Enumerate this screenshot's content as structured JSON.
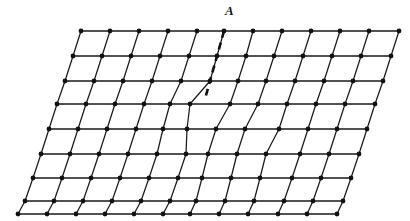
{
  "figure": {
    "kind": "crystal-lattice-edge-dislocation-diagram",
    "background_color": "#ffffff",
    "line_color": "#1a1a1a",
    "node_color": "#111111",
    "node_radius": 2.4,
    "line_width": 1.25,
    "width": 410,
    "height": 221
  },
  "annotations": [
    {
      "name": "point-label-A",
      "text": "A",
      "x": 225,
      "y": 4,
      "style": "italic-bold-serif"
    }
  ],
  "slip_plane_marker": {
    "name": "dashed-extra-half-plane",
    "style": "dashed",
    "dash_pattern": "7,5",
    "line_width": 2.6,
    "color": "#111111",
    "points": [
      [
        224,
        31
      ],
      [
        217,
        56
      ],
      [
        210,
        81
      ],
      [
        205,
        99
      ]
    ]
  },
  "chart_data": {
    "type": "scatter",
    "xlabel": "",
    "ylabel": "",
    "grid": true,
    "legend": null,
    "lattice": {
      "rows": 9,
      "cols": 12,
      "origin": [
        81,
        31
      ],
      "col_spacing": 29,
      "row_spacing": 25,
      "row_shear_x": -8,
      "description": "Parallelogram lattice with an extra half-plane of atoms inserted above the dislocation core at node A; rows below the core distort to accommodate the missing half column."
    },
    "rows": [
      {
        "index": 0,
        "y": 31,
        "points": [
          [
            81,
            31
          ],
          [
            110,
            31
          ],
          [
            139,
            31
          ],
          [
            168,
            31
          ],
          [
            197,
            31
          ],
          [
            224,
            31
          ],
          [
            253,
            31
          ],
          [
            282,
            31
          ],
          [
            311,
            31
          ],
          [
            340,
            31
          ],
          [
            369,
            31
          ],
          [
            399,
            31
          ]
        ]
      },
      {
        "index": 1,
        "y": 56,
        "points": [
          [
            73,
            56
          ],
          [
            102,
            56
          ],
          [
            131,
            56
          ],
          [
            160,
            56
          ],
          [
            189,
            56
          ],
          [
            217,
            56
          ],
          [
            246,
            56
          ],
          [
            274,
            56
          ],
          [
            303,
            56
          ],
          [
            332,
            56
          ],
          [
            361,
            56
          ],
          [
            391,
            56
          ]
        ]
      },
      {
        "index": 2,
        "y": 81,
        "points": [
          [
            65,
            81
          ],
          [
            94,
            81
          ],
          [
            123,
            81
          ],
          [
            152,
            81
          ],
          [
            181,
            81
          ],
          [
            210,
            81
          ],
          [
            238,
            81
          ],
          [
            266,
            81
          ],
          [
            295,
            81
          ],
          [
            324,
            81
          ],
          [
            353,
            81
          ],
          [
            383,
            81
          ]
        ]
      },
      {
        "index": 3,
        "y": 104,
        "points": [
          [
            57,
            104
          ],
          [
            86,
            104
          ],
          [
            115,
            104
          ],
          [
            144,
            104
          ],
          [
            170,
            104
          ],
          [
            190,
            104
          ],
          [
            230,
            104
          ],
          [
            258,
            104
          ],
          [
            287,
            104
          ],
          [
            316,
            104
          ],
          [
            345,
            104
          ],
          [
            375,
            104
          ]
        ]
      },
      {
        "index": 4,
        "y": 129,
        "points": [
          [
            49,
            129
          ],
          [
            78,
            129
          ],
          [
            107,
            129
          ],
          [
            136,
            129
          ],
          [
            163,
            129
          ],
          [
            187,
            129
          ],
          [
            216,
            129
          ],
          [
            245,
            129
          ],
          [
            279,
            129
          ],
          [
            308,
            129
          ],
          [
            337,
            129
          ],
          [
            367,
            129
          ]
        ]
      },
      {
        "index": 5,
        "y": 154,
        "points": [
          [
            41,
            154
          ],
          [
            70,
            154
          ],
          [
            99,
            154
          ],
          [
            128,
            154
          ],
          [
            157,
            154
          ],
          [
            186,
            154
          ],
          [
            208,
            154
          ],
          [
            237,
            154
          ],
          [
            266,
            154
          ],
          [
            300,
            154
          ],
          [
            329,
            154
          ],
          [
            359,
            154
          ]
        ]
      },
      {
        "index": 6,
        "y": 178,
        "points": [
          [
            33,
            178
          ],
          [
            62,
            178
          ],
          [
            91,
            178
          ],
          [
            120,
            178
          ],
          [
            149,
            178
          ],
          [
            178,
            178
          ],
          [
            202,
            178
          ],
          [
            231,
            178
          ],
          [
            260,
            178
          ],
          [
            292,
            178
          ],
          [
            321,
            178
          ],
          [
            351,
            178
          ]
        ]
      },
      {
        "index": 7,
        "y": 201,
        "points": [
          [
            25,
            201
          ],
          [
            54,
            201
          ],
          [
            83,
            201
          ],
          [
            112,
            201
          ],
          [
            141,
            201
          ],
          [
            170,
            201
          ],
          [
            196,
            201
          ],
          [
            225,
            201
          ],
          [
            254,
            201
          ],
          [
            284,
            201
          ],
          [
            313,
            201
          ],
          [
            343,
            201
          ]
        ]
      },
      {
        "index": 8,
        "y": 214,
        "points": [
          [
            18,
            214
          ],
          [
            47,
            214
          ],
          [
            76,
            214
          ],
          [
            105,
            214
          ],
          [
            134,
            214
          ],
          [
            163,
            214
          ],
          [
            190,
            214
          ],
          [
            219,
            214
          ],
          [
            248,
            214
          ],
          [
            278,
            214
          ],
          [
            307,
            214
          ],
          [
            337,
            214
          ]
        ]
      }
    ]
  }
}
